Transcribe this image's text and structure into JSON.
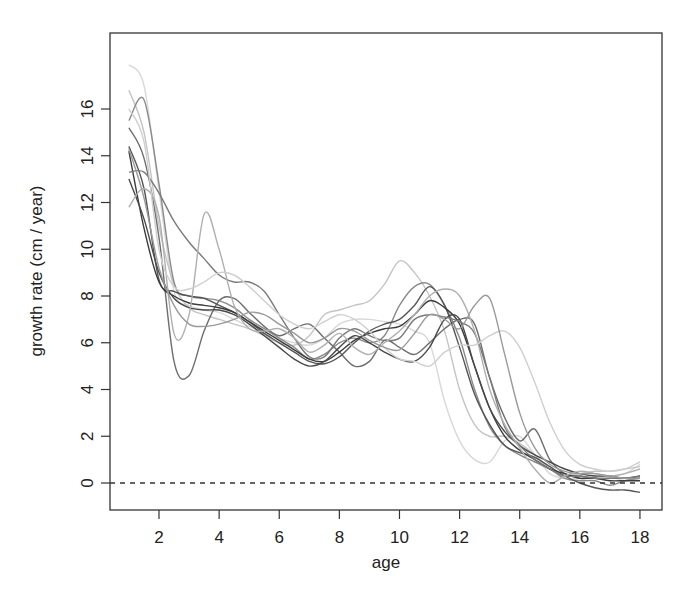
{
  "chart_data": {
    "type": "line",
    "title": "",
    "xlabel": "age",
    "ylabel": "growth rate (cm / year)",
    "xlim": [
      0.5,
      18.7
    ],
    "ylim": [
      -1.1,
      19.0
    ],
    "x_ticks": [
      2,
      4,
      6,
      8,
      10,
      12,
      14,
      16,
      18
    ],
    "y_ticks": [
      0,
      2,
      4,
      6,
      8,
      10,
      12,
      14,
      16
    ],
    "grid": false,
    "legend": "none",
    "reference_line": {
      "y": 0,
      "style": "dashed"
    },
    "x": [
      1,
      1.5,
      2,
      2.5,
      3,
      3.5,
      4,
      4.5,
      5,
      5.5,
      6,
      6.5,
      7,
      7.5,
      8,
      8.5,
      9,
      9.5,
      10,
      10.5,
      11,
      11.5,
      12,
      12.5,
      13,
      13.5,
      14,
      14.5,
      15,
      15.5,
      16,
      16.5,
      17,
      17.5,
      18
    ],
    "series": [
      {
        "name": "curve-1",
        "color": "#d8d8d8",
        "values": [
          17.9,
          17.0,
          12.5,
          8.2,
          7.6,
          7.4,
          7.3,
          7.0,
          6.7,
          6.4,
          6.2,
          6.0,
          5.9,
          6.2,
          6.8,
          7.0,
          7.0,
          6.9,
          6.8,
          6.5,
          6.0,
          3.5,
          1.8,
          1.0,
          0.9,
          1.8,
          2.0,
          1.2,
          0.4,
          0.2,
          0.2,
          0.3,
          0.3,
          0.4,
          0.8
        ]
      },
      {
        "name": "curve-2",
        "color": "#c4c4c4",
        "values": [
          16.8,
          15.0,
          11.0,
          8.5,
          7.5,
          7.2,
          7.0,
          6.8,
          6.6,
          6.3,
          6.0,
          5.9,
          6.3,
          7.2,
          7.4,
          7.6,
          7.8,
          8.5,
          9.5,
          9.0,
          8.0,
          6.5,
          4.0,
          2.5,
          2.0,
          2.0,
          1.7,
          1.2,
          0.6,
          0.3,
          0.4,
          0.5,
          0.5,
          0.6,
          0.7
        ]
      },
      {
        "name": "curve-3",
        "color": "#8a8a8a",
        "values": [
          15.5,
          16.4,
          12.8,
          8.6,
          8.0,
          7.9,
          7.8,
          7.5,
          7.0,
          6.6,
          6.2,
          5.8,
          5.3,
          5.5,
          6.0,
          6.2,
          6.0,
          6.3,
          7.6,
          8.4,
          8.5,
          7.6,
          6.2,
          4.0,
          2.4,
          1.6,
          1.2,
          0.9,
          0.6,
          0.2,
          0.1,
          0.1,
          -0.1,
          0.1,
          0.2
        ]
      },
      {
        "name": "curve-4",
        "color": "#6e6e6e",
        "values": [
          15.2,
          13.9,
          10.5,
          5.2,
          4.6,
          6.5,
          7.8,
          7.9,
          7.3,
          6.7,
          6.3,
          6.6,
          6.8,
          6.2,
          5.6,
          5.0,
          5.2,
          6.1,
          5.8,
          5.5,
          6.0,
          6.6,
          7.0,
          6.8,
          4.5,
          2.8,
          1.8,
          2.3,
          1.0,
          0.4,
          0.3,
          0.2,
          0.2,
          0.2,
          0.2
        ]
      },
      {
        "name": "curve-5",
        "color": "#555555",
        "values": [
          14.4,
          12.6,
          8.7,
          8.2,
          8.0,
          7.9,
          7.6,
          7.3,
          6.9,
          6.4,
          6.0,
          5.6,
          5.2,
          5.1,
          5.4,
          6.0,
          6.5,
          6.8,
          7.0,
          7.6,
          8.4,
          7.6,
          5.8,
          3.8,
          2.5,
          1.6,
          1.3,
          1.1,
          0.7,
          0.3,
          0.0,
          -0.2,
          -0.3,
          -0.3,
          -0.4
        ]
      },
      {
        "name": "curve-6",
        "color": "#3c3c3c",
        "values": [
          14.2,
          10.9,
          8.6,
          8.0,
          7.7,
          7.6,
          7.5,
          7.3,
          6.9,
          6.5,
          6.1,
          5.7,
          5.3,
          5.2,
          5.6,
          6.1,
          6.4,
          6.6,
          6.7,
          7.2,
          7.8,
          7.5,
          6.8,
          5.0,
          3.2,
          2.0,
          1.4,
          1.0,
          0.6,
          0.4,
          0.2,
          0.2,
          0.1,
          0.1,
          0.1
        ]
      },
      {
        "name": "curve-7",
        "color": "#4a4a4a",
        "values": [
          13.0,
          11.3,
          9.0,
          7.9,
          7.5,
          7.4,
          7.4,
          7.2,
          6.8,
          6.3,
          5.8,
          5.3,
          5.0,
          5.2,
          5.8,
          6.3,
          6.0,
          5.6,
          5.3,
          5.2,
          5.8,
          7.0,
          7.0,
          5.0,
          3.2,
          2.2,
          1.6,
          1.2,
          0.9,
          0.6,
          0.4,
          0.3,
          0.3,
          0.2,
          0.3
        ]
      },
      {
        "name": "curve-8",
        "color": "#7a7a7a",
        "values": [
          13.3,
          13.3,
          12.4,
          11.2,
          10.3,
          9.6,
          8.9,
          8.6,
          8.6,
          8.2,
          7.2,
          6.2,
          5.4,
          5.4,
          6.2,
          6.6,
          6.3,
          6.1,
          6.2,
          7.0,
          7.2,
          7.1,
          6.9,
          6.4,
          4.5,
          2.4,
          1.6,
          1.0,
          0.6,
          0.3,
          0.3,
          0.2,
          0.2,
          0.2,
          0.3
        ]
      },
      {
        "name": "curve-9",
        "color": "#b0b0b0",
        "values": [
          11.8,
          12.6,
          11.4,
          6.4,
          7.2,
          11.5,
          10.0,
          7.6,
          6.6,
          6.5,
          6.6,
          6.2,
          5.6,
          5.9,
          6.4,
          5.8,
          5.5,
          6.0,
          6.5,
          7.2,
          8.0,
          8.3,
          8.0,
          6.5,
          4.0,
          2.5,
          1.5,
          0.6,
          0.0,
          0.3,
          0.5,
          0.4,
          0.3,
          0.4,
          0.6
        ]
      },
      {
        "name": "curve-10",
        "color": "#cfcfcf",
        "values": [
          16.0,
          14.6,
          10.0,
          8.4,
          8.3,
          8.6,
          9.0,
          8.9,
          8.4,
          7.8,
          7.2,
          6.8,
          6.6,
          6.9,
          7.2,
          7.0,
          6.5,
          5.8,
          5.3,
          5.2,
          5.0,
          5.6,
          5.9,
          5.9,
          6.3,
          6.5,
          5.8,
          4.3,
          2.6,
          1.4,
          0.8,
          0.6,
          0.5,
          0.6,
          0.9
        ]
      },
      {
        "name": "curve-11",
        "color": "#9a9a9a",
        "values": [
          14.3,
          12.2,
          9.2,
          7.6,
          6.8,
          6.7,
          6.8,
          7.0,
          7.3,
          7.2,
          6.8,
          6.4,
          6.0,
          6.2,
          6.6,
          6.5,
          6.1,
          5.8,
          5.7,
          6.4,
          7.2,
          7.0,
          6.6,
          7.6,
          7.9,
          5.5,
          3.0,
          1.5,
          0.8,
          0.5,
          0.4,
          0.4,
          0.3,
          0.2,
          0.2
        ]
      }
    ]
  }
}
